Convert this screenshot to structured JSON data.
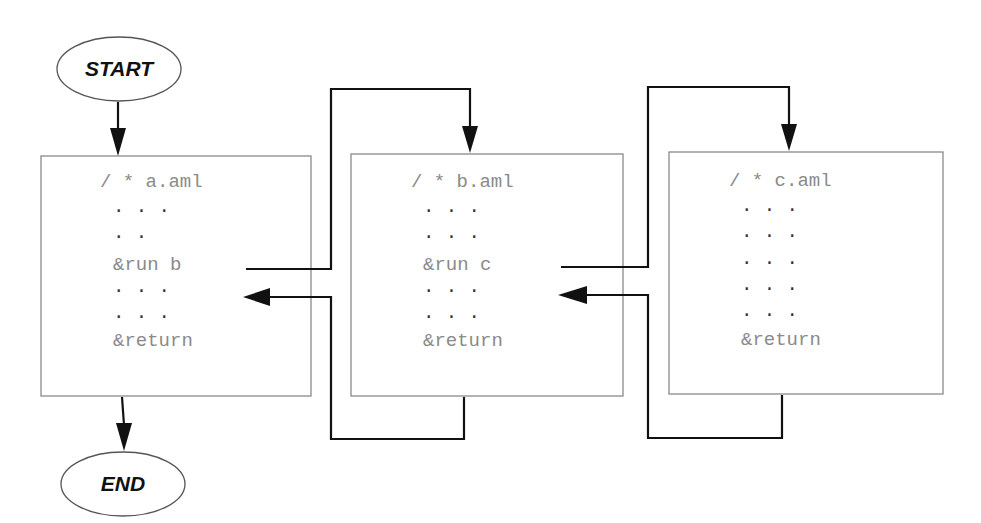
{
  "terminals": {
    "start": "START",
    "end": "END"
  },
  "files": [
    {
      "name": "a.aml",
      "comment": "/ * a.aml",
      "lines": [
        "· · ·",
        "· ·",
        "&run b",
        "· · ·",
        "· · ·",
        "&return"
      ]
    },
    {
      "name": "b.aml",
      "comment": "/ * b.aml",
      "lines": [
        "· · ·",
        "· · ·",
        "&run c",
        "· · ·",
        "· · ·",
        "&return"
      ]
    },
    {
      "name": "c.aml",
      "comment": "/ * c.aml",
      "lines": [
        "· · ·",
        "· · ·",
        "· · ·",
        "· · ·",
        "· · ·",
        "&return"
      ]
    }
  ],
  "connections": [
    {
      "from": "START",
      "to": "a.aml"
    },
    {
      "from": "a.aml &run b",
      "to": "b.aml"
    },
    {
      "from": "b.aml &return",
      "to": "a.aml"
    },
    {
      "from": "b.aml &run c",
      "to": "c.aml"
    },
    {
      "from": "c.aml &return",
      "to": "b.aml"
    },
    {
      "from": "a.aml",
      "to": "END"
    }
  ]
}
